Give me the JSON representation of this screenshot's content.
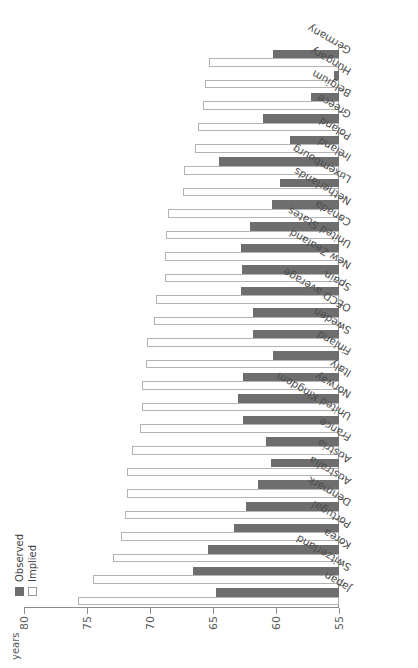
{
  "chart_data": {
    "type": "bar",
    "title": "",
    "xlabel": "",
    "ylabel": "years",
    "ylim": [
      55,
      80
    ],
    "yticks": [
      "55",
      "60",
      "65",
      "70",
      "75",
      "80"
    ],
    "grid": false,
    "orientation": "horizontal-rotated",
    "legend_position": "top-left",
    "categories": [
      "Japan",
      "Switzerland",
      "Korea",
      "Portugal",
      "Denmark",
      "Australia",
      "Austria",
      "France",
      "United Kingdom",
      "Norway",
      "Italy",
      "Finland",
      "Sweden",
      "OECD average",
      "Spain",
      "New Zealand",
      "United States",
      "Canada",
      "Netherlands",
      "Luxembourg",
      "Ireland",
      "Poland",
      "Greece",
      "Belgium",
      "Hungary",
      "Germany"
    ],
    "series": [
      {
        "name": "Observed",
        "color": "#6e6e6e",
        "values": [
          64.8,
          66.6,
          65.4,
          63.3,
          62.4,
          61.4,
          60.4,
          60.8,
          62.6,
          63.0,
          62.6,
          60.2,
          61.8,
          61.8,
          62.8,
          62.7,
          62.8,
          62.1,
          60.3,
          59.7,
          64.5,
          58.9,
          61.0,
          57.2,
          55.4,
          60.2
        ]
      },
      {
        "name": "Implied",
        "color": "#ffffff",
        "values": [
          75.7,
          74.5,
          72.9,
          72.3,
          72.0,
          71.8,
          71.8,
          71.4,
          70.8,
          70.6,
          70.6,
          70.3,
          70.2,
          69.7,
          69.5,
          68.8,
          68.8,
          68.7,
          68.6,
          67.4,
          67.3,
          66.4,
          66.2,
          65.8,
          65.6,
          65.3
        ]
      }
    ]
  },
  "legend": {
    "items": [
      {
        "label": "Observed"
      },
      {
        "label": "Implied"
      }
    ]
  },
  "axis": {
    "unit_label": "years"
  }
}
